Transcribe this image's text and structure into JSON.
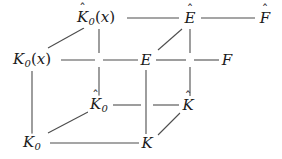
{
  "diagram": {
    "type": "commutative-cube",
    "width": 282,
    "height": 159,
    "background": "#ffffff",
    "line_color": "#4d4d4d",
    "text_color": "#1a1a1a",
    "nodes": [
      {
        "id": "K0hat_x",
        "base": "K",
        "hat": true,
        "sub": "0",
        "arg": "(x)",
        "x": 96,
        "y": 18,
        "label": "K̂0(x)"
      },
      {
        "id": "Ehat",
        "base": "E",
        "hat": true,
        "sub": "",
        "arg": "",
        "x": 190,
        "y": 18,
        "label": "Ê"
      },
      {
        "id": "Fhat",
        "base": "F",
        "hat": true,
        "sub": "",
        "arg": "",
        "x": 265,
        "y": 18,
        "label": "F̂"
      },
      {
        "id": "K0_x",
        "base": "K",
        "hat": false,
        "sub": "0",
        "arg": "(x)",
        "x": 32,
        "y": 60,
        "label": "K0(x)"
      },
      {
        "id": "E",
        "base": "E",
        "hat": false,
        "sub": "",
        "arg": "",
        "x": 146,
        "y": 60,
        "label": "E"
      },
      {
        "id": "F",
        "base": "F",
        "hat": false,
        "sub": "",
        "arg": "",
        "x": 227,
        "y": 60,
        "label": "F"
      },
      {
        "id": "K0hat",
        "base": "K",
        "hat": true,
        "sub": "0",
        "arg": "",
        "x": 99,
        "y": 105,
        "label": "K̂0"
      },
      {
        "id": "Khat",
        "base": "K",
        "hat": true,
        "sub": "",
        "arg": "",
        "x": 188,
        "y": 105,
        "label": "K̂"
      },
      {
        "id": "K0",
        "base": "K",
        "hat": false,
        "sub": "0",
        "arg": "",
        "x": 32,
        "y": 143,
        "label": "K0"
      },
      {
        "id": "K",
        "base": "K",
        "hat": false,
        "sub": "",
        "arg": "",
        "x": 147,
        "y": 143,
        "label": "K"
      }
    ],
    "edges": [
      {
        "id": "e-top-1",
        "from": "K0hat_x",
        "to": "Ehat",
        "kind": "horizontal"
      },
      {
        "id": "e-top-2",
        "from": "Ehat",
        "to": "Fhat",
        "kind": "horizontal"
      },
      {
        "id": "e-mid-1",
        "from": "K0_x",
        "to": "E",
        "kind": "horizontal"
      },
      {
        "id": "e-mid-2",
        "from": "E",
        "to": "F",
        "kind": "horizontal"
      },
      {
        "id": "e-third-1",
        "from": "K0hat",
        "to": "Khat",
        "kind": "horizontal"
      },
      {
        "id": "e-bot-1",
        "from": "K0",
        "to": "K",
        "kind": "horizontal"
      },
      {
        "id": "e-v-left",
        "from": "K0_x",
        "to": "K0",
        "kind": "vertical"
      },
      {
        "id": "e-v-hatleft",
        "from": "K0hat_x",
        "to": "K0hat",
        "kind": "vertical"
      },
      {
        "id": "e-v-E",
        "from": "E",
        "to": "K",
        "kind": "vertical"
      },
      {
        "id": "e-v-hatE",
        "from": "Ehat",
        "to": "Khat",
        "kind": "vertical"
      },
      {
        "id": "e-d-K0x",
        "from": "K0_x",
        "to": "K0hat_x",
        "kind": "diagonal"
      },
      {
        "id": "e-d-E",
        "from": "E",
        "to": "Ehat",
        "kind": "diagonal"
      },
      {
        "id": "e-d-K0",
        "from": "K0",
        "to": "K0hat",
        "kind": "diagonal"
      },
      {
        "id": "e-d-K",
        "from": "K",
        "to": "Khat",
        "kind": "diagonal"
      }
    ],
    "hat_glyph": "ˆ"
  }
}
